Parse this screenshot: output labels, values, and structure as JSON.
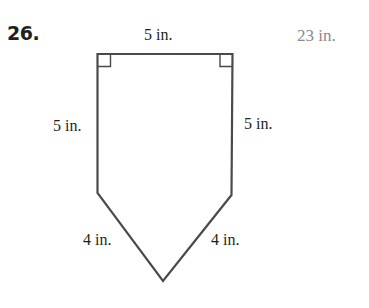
{
  "problem": {
    "number": "26.",
    "answer": "23 in."
  },
  "figure": {
    "shape": "pentagon",
    "labels": {
      "top": "5 in.",
      "left": "5 in.",
      "right": "5 in.",
      "bottom_left": "4 in.",
      "bottom_right": "4 in."
    },
    "colors": {
      "stroke": "#4a4a4a",
      "text": "#231f20",
      "answer": "#8a8a8a"
    }
  }
}
